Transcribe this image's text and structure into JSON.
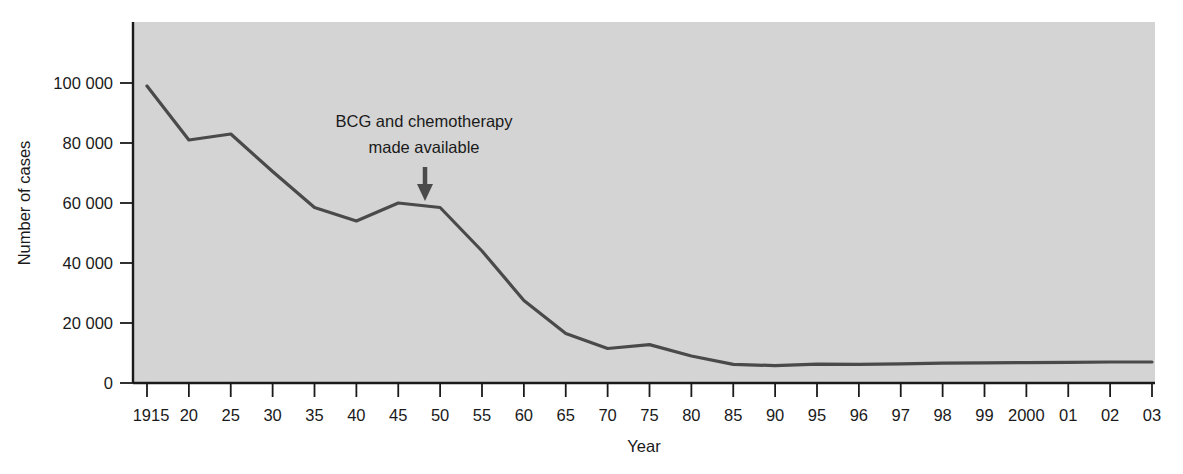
{
  "chart_data": {
    "type": "line",
    "title": "",
    "xlabel": "Year",
    "ylabel": "Number of cases",
    "ylim": [
      0,
      115000
    ],
    "yticks": [
      0,
      20000,
      40000,
      60000,
      80000,
      100000
    ],
    "ytick_labels": [
      "0",
      "20 000",
      "40 000",
      "60 000",
      "80 000",
      "100 000"
    ],
    "grid": false,
    "legend": "none",
    "plot_background": "#d4d4d4",
    "line_color": "#4a4a4a",
    "axis_color": "#1a1a1a",
    "categories": [
      "1915",
      "20",
      "25",
      "30",
      "35",
      "40",
      "45",
      "50",
      "55",
      "60",
      "65",
      "70",
      "75",
      "80",
      "85",
      "90",
      "95",
      "96",
      "97",
      "98",
      "99",
      "2000",
      "01",
      "02",
      "03"
    ],
    "x": [
      1915,
      1920,
      1925,
      1930,
      1935,
      1940,
      1945,
      1950,
      1955,
      1960,
      1965,
      1970,
      1975,
      1980,
      1985,
      1990,
      1995,
      1996,
      1997,
      1998,
      1999,
      2000,
      2001,
      2002,
      2003
    ],
    "values": [
      99000,
      81000,
      83000,
      70500,
      58500,
      54000,
      60000,
      58500,
      44000,
      27500,
      16500,
      11500,
      12800,
      9000,
      6200,
      5800,
      6300,
      6200,
      6400,
      6600,
      6700,
      6800,
      6900,
      7000,
      7000
    ],
    "series": [
      {
        "name": "Number of cases",
        "values": [
          99000,
          81000,
          83000,
          70500,
          58500,
          54000,
          60000,
          58500,
          44000,
          27500,
          16500,
          11500,
          12800,
          9000,
          6200,
          5800,
          6300,
          6200,
          6400,
          6600,
          6700,
          6800,
          6900,
          7000,
          7000
        ]
      }
    ],
    "annotations": [
      {
        "line1": "BCG and chemotherapy",
        "line2": "made available",
        "arrow": "down-arrow",
        "points_at_year": 1948
      }
    ]
  }
}
